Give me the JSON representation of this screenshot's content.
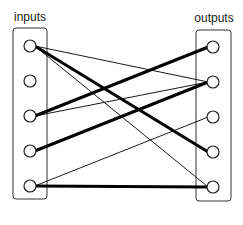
{
  "diagram": {
    "type": "bipartite-network",
    "inputs": {
      "label": "inputs",
      "nodes": [
        {
          "id": "in1",
          "cx": 30,
          "cy": 46
        },
        {
          "id": "in2",
          "cx": 30,
          "cy": 81
        },
        {
          "id": "in3",
          "cx": 30,
          "cy": 116
        },
        {
          "id": "in4",
          "cx": 30,
          "cy": 151
        },
        {
          "id": "in5",
          "cx": 30,
          "cy": 186
        }
      ]
    },
    "outputs": {
      "label": "outputs",
      "nodes": [
        {
          "id": "out1",
          "cx": 213,
          "cy": 47
        },
        {
          "id": "out2",
          "cx": 213,
          "cy": 82
        },
        {
          "id": "out3",
          "cx": 213,
          "cy": 117
        },
        {
          "id": "out4",
          "cx": 213,
          "cy": 152
        },
        {
          "id": "out5",
          "cx": 213,
          "cy": 187
        }
      ]
    },
    "edges": [
      {
        "from": "in1",
        "to": "out2",
        "weight": "thin"
      },
      {
        "from": "in1",
        "to": "out4",
        "weight": "thick"
      },
      {
        "from": "in1",
        "to": "out5",
        "weight": "thin"
      },
      {
        "from": "in3",
        "to": "out1",
        "weight": "thick"
      },
      {
        "from": "in3",
        "to": "out2",
        "weight": "thin"
      },
      {
        "from": "in4",
        "to": "out2",
        "weight": "thick"
      },
      {
        "from": "in5",
        "to": "out3",
        "weight": "thin"
      },
      {
        "from": "in5",
        "to": "out5",
        "weight": "thick"
      }
    ],
    "colors": {
      "line": "#000000",
      "box": "#333333",
      "node_fill": "#ffffff"
    }
  }
}
